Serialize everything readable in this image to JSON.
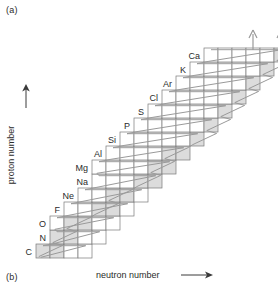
{
  "figure": {
    "panel_a_label": "(a)",
    "panel_b_label": "(b)",
    "y_axis_label": "proton number",
    "x_axis_label": "neutron number",
    "colors": {
      "cell_fill_shaded": "#dcdcdc",
      "cell_fill_empty": "#ffffff",
      "cell_stroke": "#7a7a7a",
      "path_stroke": "#9a9a9a",
      "text": "#2b2b2b",
      "arrow": "#9a9a9a"
    },
    "arrows": {
      "y_axis_arrow": "up-arrow",
      "x_axis_arrow": "right-arrow",
      "top_arrow_count": 2
    }
  },
  "chart_data": {
    "type": "heatmap",
    "title": "",
    "xlabel": "neutron number",
    "ylabel": "proton number",
    "grid": true,
    "legend": null,
    "cell_px": {
      "w": 14,
      "h": 14
    },
    "origin_px": {
      "x": 36,
      "y": 258
    },
    "row_count": 15,
    "note": "Chart of nuclides: each row is one element (constant proton number); cells are isotopes ordered by neutron number. Shaded cells are the highlighted/stable isotopes; the zigzag polyline traces the reaction path. Two up-arrows exit the top-right.",
    "rows": [
      {
        "label": "C",
        "proton_number": 6,
        "n_start": 0,
        "cells": 4,
        "shaded": [
          0,
          1
        ]
      },
      {
        "label": "N",
        "proton_number": 7,
        "n_start": 1,
        "cells": 4,
        "shaded": [
          0,
          1
        ]
      },
      {
        "label": "O",
        "proton_number": 8,
        "n_start": 1,
        "cells": 5,
        "shaded": [
          1,
          2
        ]
      },
      {
        "label": "F",
        "proton_number": 9,
        "n_start": 2,
        "cells": 5,
        "shaded": [
          2,
          3
        ]
      },
      {
        "label": "Ne",
        "proton_number": 10,
        "n_start": 3,
        "cells": 5,
        "shaded": [
          2,
          3
        ]
      },
      {
        "label": "Na",
        "proton_number": 11,
        "n_start": 4,
        "cells": 5,
        "shaded": [
          3,
          4
        ]
      },
      {
        "label": "Mg",
        "proton_number": 12,
        "n_start": 4,
        "cells": 6,
        "shaded": [
          4,
          5
        ]
      },
      {
        "label": "Al",
        "proton_number": 13,
        "n_start": 5,
        "cells": 6,
        "shaded": [
          4,
          5
        ]
      },
      {
        "label": "Si",
        "proton_number": 14,
        "n_start": 6,
        "cells": 6,
        "shaded": [
          5,
          6
        ]
      },
      {
        "label": "P",
        "proton_number": 15,
        "n_start": 7,
        "cells": 6,
        "shaded": [
          5,
          6
        ]
      },
      {
        "label": "S",
        "proton_number": 16,
        "n_start": 8,
        "cells": 6,
        "shaded": [
          5,
          6
        ]
      },
      {
        "label": "Cl",
        "proton_number": 17,
        "n_start": 9,
        "cells": 6,
        "shaded": [
          5,
          6
        ]
      },
      {
        "label": "Ar",
        "proton_number": 18,
        "n_start": 10,
        "cells": 6,
        "shaded": [
          5,
          6
        ]
      },
      {
        "label": "K",
        "proton_number": 19,
        "n_start": 11,
        "cells": 6,
        "shaded": [
          5,
          6
        ]
      },
      {
        "label": "Ca",
        "proton_number": 20,
        "n_start": 12,
        "cells": 6,
        "shaded": [
          5,
          6
        ]
      }
    ],
    "row_labels": [
      "C",
      "N",
      "O",
      "F",
      "Ne",
      "Na",
      "Mg",
      "Al",
      "Si",
      "P",
      "S",
      "Cl",
      "Ar",
      "K",
      "Ca"
    ]
  }
}
